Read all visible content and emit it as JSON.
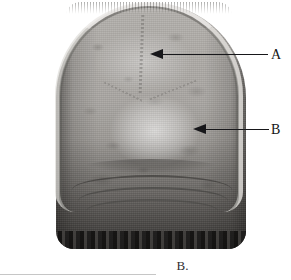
{
  "figure": {
    "caption": "B.",
    "alt": "Grayscale photograph of a human skull viewed from behind, showing the cranial vault and occipital region",
    "annotations": [
      {
        "id": "a",
        "label": "A",
        "arrow": "leader-arrow-left",
        "points_to": "upper-parietal-region"
      },
      {
        "id": "b",
        "label": "B",
        "arrow": "leader-arrow-left",
        "points_to": "lambdoid-suture-region"
      }
    ]
  },
  "colors": {
    "ink": "#17171a",
    "caption": "#2e2e31",
    "page": "#ffffff",
    "bone_light": "#b4b1ad",
    "bone_mid": "#8d8a86",
    "bone_dark": "#6e6b68",
    "base_band": "#1f1e1d",
    "scan_rule": "#c6c6c6"
  }
}
